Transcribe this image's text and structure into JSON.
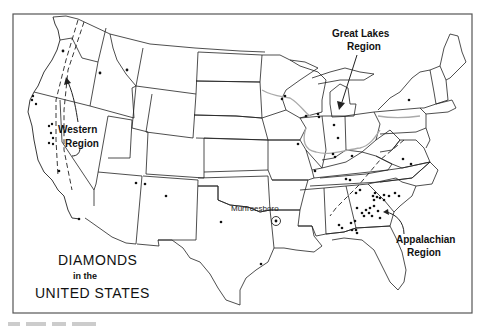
{
  "figure": {
    "title_line1": "DIAMONDS",
    "title_line2": "in the",
    "title_line3": "UNITED STATES"
  },
  "regions": [
    {
      "id": "western",
      "line1": "Western",
      "line2": "Region"
    },
    {
      "id": "great-lakes",
      "line1": "Great Lakes",
      "line2": "Region"
    },
    {
      "id": "appalachian",
      "line1": "Appalachian",
      "line2": "Region"
    }
  ],
  "places": [
    {
      "id": "murfreesboro",
      "label": "Murfreesboro",
      "symbol": "circled-dot"
    }
  ],
  "map": {
    "frame": {
      "x": 13,
      "y": 14,
      "width": 459,
      "height": 299
    },
    "colors": {
      "line": "#222222",
      "river": "#aaaaaa",
      "frame": "#555555",
      "background": "#ffffff"
    }
  }
}
